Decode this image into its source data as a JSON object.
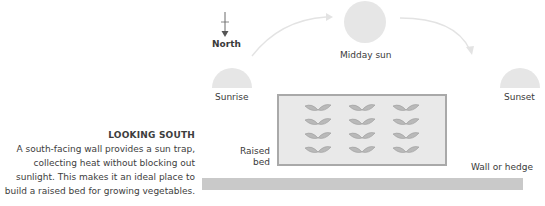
{
  "caption": {
    "title": "LOOKING SOUTH",
    "lines": [
      "A south-facing wall provides a sun trap,",
      "collecting heat without blocking out",
      "sunlight. This makes it an ideal place to",
      "build a raised bed for growing vegetables."
    ]
  },
  "labels": {
    "north": "North",
    "sunrise": "Sunrise",
    "midday": "Midday sun",
    "sunset": "Sunset",
    "raised_bed_line1": "Raised",
    "raised_bed_line2": "bed",
    "wall": "Wall or hedge"
  },
  "colors": {
    "sun": "#e6e6e6",
    "bed_fill": "#e9e9e9",
    "bed_border": "#a9a9a9",
    "leaf": "#b9b9b9",
    "wall": "#c9c9c9",
    "arc": "#e3e3e3"
  },
  "bed": {
    "rows": 4,
    "cols": 3
  }
}
